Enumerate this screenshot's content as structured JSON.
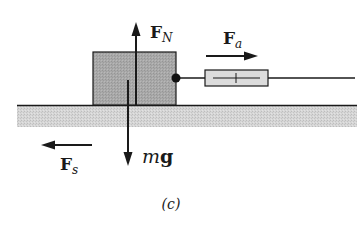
{
  "diagram": {
    "caption": "(c)",
    "colors": {
      "block_fill": "#a8a8a8",
      "ground_fill": "#d4d4d4",
      "gauge_fill": "#dcdcdc",
      "stroke": "#1a1a1a"
    },
    "forces": {
      "normal": {
        "label_main": "F",
        "label_sub": "N"
      },
      "applied": {
        "label_main": "F",
        "label_sub": "a"
      },
      "static_friction": {
        "label_main": "F",
        "label_sub": "s"
      },
      "weight": {
        "label_main": "m",
        "label_bold": "g"
      }
    },
    "elements": [
      "block",
      "ground",
      "spring-scale",
      "string",
      "attachment-point"
    ]
  }
}
